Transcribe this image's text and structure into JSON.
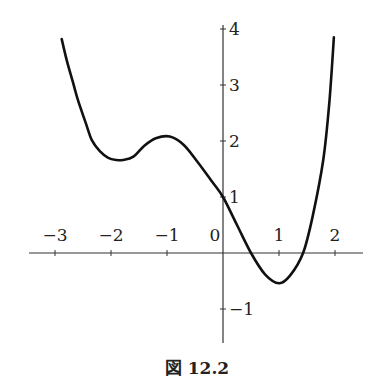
{
  "figure": {
    "caption": "図 12.2",
    "colors": {
      "curve": "#111111",
      "axis": "#333333",
      "background": "#ffffff"
    }
  },
  "chart_data": {
    "type": "line",
    "title": "",
    "caption": "図 12.2",
    "xlabel": "",
    "ylabel": "",
    "xlim": [
      -3.5,
      2.5
    ],
    "ylim": [
      -1.6,
      4.0
    ],
    "grid": false,
    "legend": null,
    "x_ticks": [
      -3,
      -2,
      -1,
      0,
      1,
      2
    ],
    "x_tick_labels": [
      "−3",
      "−2",
      "−1",
      "0",
      "1",
      "2"
    ],
    "y_ticks": [
      4,
      3,
      2,
      1,
      -1
    ],
    "y_tick_labels": [
      "4",
      "3",
      "2",
      "1",
      "−1"
    ],
    "series": [
      {
        "name": "f(x)",
        "x": [
          -2.88,
          -2.79,
          -2.68,
          -2.59,
          -2.45,
          -2.34,
          -2.2,
          -2.05,
          -1.9,
          -1.79,
          -1.6,
          -1.4,
          -1.2,
          -0.95,
          -0.7,
          -0.45,
          -0.2,
          0.0,
          0.25,
          0.5,
          0.75,
          1.0,
          1.2,
          1.43,
          1.6,
          1.79,
          1.9,
          1.98
        ],
        "y": [
          3.82,
          3.44,
          3.05,
          2.73,
          2.32,
          2.01,
          1.82,
          1.7,
          1.66,
          1.66,
          1.72,
          1.92,
          2.05,
          2.08,
          1.93,
          1.62,
          1.28,
          1.0,
          0.5,
          0.0,
          -0.38,
          -0.54,
          -0.4,
          0.0,
          0.65,
          1.66,
          2.7,
          3.85
        ]
      }
    ],
    "annotations": [
      {
        "label": "local min",
        "x": -1.8,
        "y": 1.66
      },
      {
        "label": "local max",
        "x": -0.95,
        "y": 2.08
      },
      {
        "label": "y-intercept",
        "x": 0,
        "y": 1
      },
      {
        "label": "local min",
        "x": 1.0,
        "y": -0.54
      }
    ]
  }
}
